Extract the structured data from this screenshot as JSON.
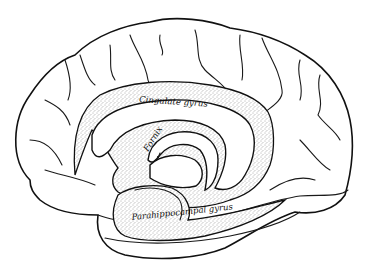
{
  "diagram": {
    "labels": [
      {
        "id": "cingulate",
        "text": "Cingulate gyrus"
      },
      {
        "id": "fornix",
        "text": "Fornix"
      },
      {
        "id": "parahippocampal",
        "text": "Parahippocampal gyrus"
      }
    ],
    "colors": {
      "line": "#111111",
      "background": "#ffffff",
      "stipple": "#555555"
    }
  }
}
